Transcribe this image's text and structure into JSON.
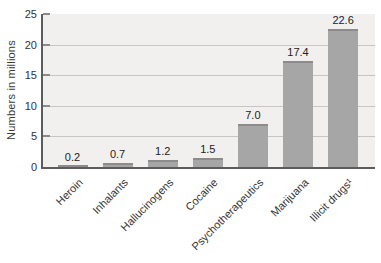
{
  "chart_data": {
    "type": "bar",
    "title": "",
    "xlabel": "",
    "ylabel": "Numbers in millions",
    "categories": [
      "Heroin",
      "Inhalants",
      "Hallucinogens",
      "Cocaine",
      "Psychotherapeutics",
      "Marijuana",
      "Illicit drugs¹"
    ],
    "values": [
      0.2,
      0.7,
      1.2,
      1.5,
      7.0,
      17.4,
      22.6
    ],
    "value_labels": [
      "0.2",
      "0.7",
      "1.2",
      "1.5",
      "7.0",
      "17.4",
      "22.6"
    ],
    "ylim": [
      0,
      25
    ],
    "yticks": [
      0,
      5,
      10,
      15,
      20,
      25
    ],
    "gridlines_at": [
      5,
      10,
      15,
      20
    ],
    "legend": null,
    "grid": true,
    "colors": {
      "bar_fill": "#a6a6a6",
      "bar_top_edge": "#8c8c8c",
      "plot_background": "#f1f0ee",
      "gridline": "#c6c5c3",
      "axis_line": "#5c5c5c",
      "tick_mark": "#8a8a8a",
      "text": "#333333"
    }
  }
}
